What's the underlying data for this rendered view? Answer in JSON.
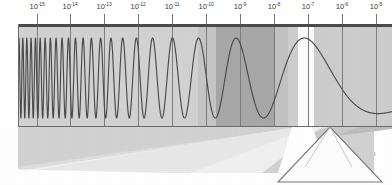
{
  "figure": {
    "axis": {
      "label": "",
      "scale": "log10",
      "unit": "m",
      "ticks": [
        {
          "mantissa": "10",
          "exponent": "-15",
          "x": 37
        },
        {
          "mantissa": "10",
          "exponent": "-14",
          "x": 70
        },
        {
          "mantissa": "10",
          "exponent": "-13",
          "x": 104
        },
        {
          "mantissa": "10",
          "exponent": "-12",
          "x": 138
        },
        {
          "mantissa": "10",
          "exponent": "-11",
          "x": 172
        },
        {
          "mantissa": "10",
          "exponent": "-10",
          "x": 206
        },
        {
          "mantissa": "10",
          "exponent": "-9",
          "x": 240
        },
        {
          "mantissa": "10",
          "exponent": "-8",
          "x": 274
        },
        {
          "mantissa": "10",
          "exponent": "-7",
          "x": 308
        },
        {
          "mantissa": "10",
          "exponent": "-6",
          "x": 342
        },
        {
          "mantissa": "10",
          "exponent": "-5",
          "x": 376
        }
      ]
    },
    "colors": {
      "plot_background": "#d2d2d2",
      "band_dark": "#a8a8a8",
      "band_medium": "#bfbfbf",
      "band_light": "#cdcdcd",
      "band_white": "#fcfcfc",
      "wave_stroke": "#4a4a4a",
      "frame": "#4a4a4a",
      "gridline": "#7d7d7d",
      "beam_dark": "#b4b4b4",
      "beam_light": "#dcdcdc",
      "prism_stroke": "#7a7a7a",
      "prism_fill": "#fdfdfd"
    },
    "bands": [
      {
        "name": "band-left-plain",
        "x": 0,
        "width": 198,
        "color": "#d2d2d2"
      },
      {
        "name": "band-mid-grey",
        "x": 198,
        "width": 18,
        "color": "#c6c6c6"
      },
      {
        "name": "band-absorption",
        "x": 216,
        "width": 58,
        "color": "#a8a8a8"
      },
      {
        "name": "band-shoulder",
        "x": 274,
        "width": 14,
        "color": "#c2c2c2"
      },
      {
        "name": "band-pre-visible",
        "x": 288,
        "width": 10,
        "color": "#cfcfcf"
      },
      {
        "name": "band-visible-white",
        "x": 298,
        "width": 16,
        "color": "#fcfcfc"
      },
      {
        "name": "band-right-plain",
        "x": 314,
        "width": 60,
        "color": "#cdcdcd"
      }
    ],
    "wave": {
      "name": "chirped-electromagnetic-wave",
      "description": "Sinusoid whose wavelength grows logarithmically from left to right, then becomes a single broad hump",
      "amplitude": 40,
      "baseline_y": 52
    },
    "prism": {
      "name": "dispersing-prism",
      "shape": "triangle",
      "apex_x": 330,
      "apex_y": 127,
      "left_x": 278,
      "right_x": 382,
      "base_y": 182
    },
    "beams": [
      {
        "name": "incident-beam-dark",
        "color": "#b4b4b4"
      },
      {
        "name": "incident-beam-light",
        "color": "#dcdcdc"
      },
      {
        "name": "refracted-beam",
        "color": "#f2f2f2"
      }
    ]
  }
}
